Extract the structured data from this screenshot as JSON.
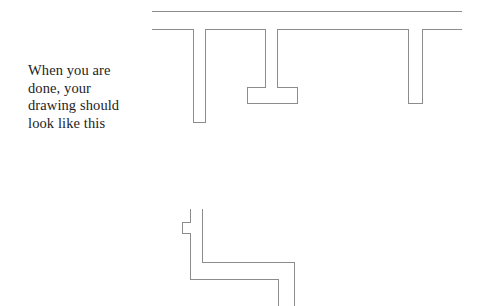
{
  "page": {
    "title": "When you are done, your drawing should look like this",
    "background_color": "#ffffff",
    "width": 484,
    "height": 306
  },
  "caption": {
    "text": "When you are\ndone, your\ndrawing should\nlook like this",
    "lines": [
      "When you are",
      "done, your",
      "drawing should",
      "look like this"
    ],
    "color": "#1d1d1d"
  },
  "drawing": {
    "stroke_color": "#8c8c8c",
    "stroke_width": 1,
    "fill": "none",
    "upper_figure": {
      "name": "wall-with-openings-plan",
      "description": "Horizontal wall plan with three vertical slots and a central pier",
      "top_line": "M152,11 L462,11",
      "outline": "M152,29 L193,29 L193,122 L205,122 L205,29 L265,29 L265,87 L247,87 L247,103 L297,103 L297,87 L277,87 L277,29 L408,29 L408,103 L422,103 L422,29 L462,29"
    },
    "lower_figure": {
      "name": "corner-wall-plan",
      "description": "L-shaped corner wall plan with a small notch on the left edge",
      "outline": "M190,209 L190,222 L182,222 L182,233 L190,233 L190,279 L278,279 L278,306 M202,209 L202,262 L294,262 L294,306"
    }
  }
}
